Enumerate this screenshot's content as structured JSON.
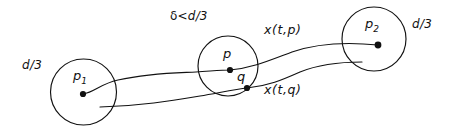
{
  "figure": {
    "name": "trajectory-through-epsilon-balls-diagram",
    "width": 459,
    "height": 137,
    "background_color": "#ffffff",
    "ink_color": "#111111"
  },
  "labels": {
    "d3_left": "d/3",
    "d3_right": "d/3",
    "delta_condition": "δ <d/3",
    "delta_symbol": "δ",
    "delta_relation": "<",
    "delta_bound": "d/3",
    "p1": "p",
    "p1_sub": "1",
    "p": "p",
    "q": "q",
    "p2": "p",
    "p2_sub": "2",
    "x_t_p": "x(t,p)",
    "x_t_q": "x(t,q)"
  },
  "circles": [
    {
      "name": "ball-around-p1",
      "cx": 83.5,
      "cy": 92,
      "r": 33,
      "radius_label": "d/3"
    },
    {
      "name": "ball-around-p",
      "cx": 228,
      "cy": 66,
      "r": 30,
      "radius_label": "δ <d/3"
    },
    {
      "name": "ball-around-p2",
      "cx": 374,
      "cy": 39,
      "r": 32,
      "radius_label": "d/3"
    }
  ],
  "points": [
    {
      "name": "point-p1",
      "label": "p₁",
      "x": 83,
      "y": 94
    },
    {
      "name": "point-p",
      "label": "p",
      "x": 230,
      "y": 70
    },
    {
      "name": "point-q",
      "label": "q",
      "x": 247,
      "y": 88
    },
    {
      "name": "point-p2",
      "label": "p₂",
      "x": 378,
      "y": 45
    }
  ],
  "curves": [
    {
      "name": "trajectory-x-t-p",
      "label": "x(t,p)",
      "from": "p1",
      "through": "p",
      "to": "p2",
      "path": "M 83 94 C 95 92 100 84 118 80 C 150 73 175 73 196 72 C 212 71 222 70 230 70 C 252 68 268 61 292 52 C 318 43 348 42 378 45"
    },
    {
      "name": "trajectory-x-t-q",
      "label": "x(t,q)",
      "from": "free-end-near-p1",
      "through": "q",
      "to": "free-end-in-p2-ball",
      "path": "M 100 107 C 140 106 170 101 200 96 C 218 93 236 89 247 88 C 268 86 282 80 300 72 C 322 63 344 62 362 62"
    }
  ]
}
